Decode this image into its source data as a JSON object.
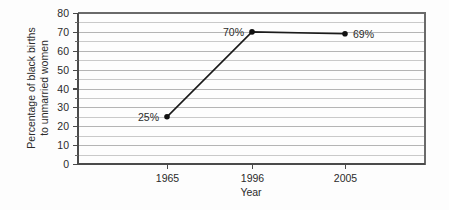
{
  "chart_data": {
    "type": "line",
    "title": "",
    "xlabel": "Year",
    "ylabel_line1": "Percentage of black births",
    "ylabel_line2": "to unmarried women",
    "categories": [
      "1965",
      "1996",
      "2005"
    ],
    "x": [
      1965,
      1996,
      2005
    ],
    "values": [
      25,
      70,
      69
    ],
    "point_labels": [
      "25%",
      "70%",
      "69%"
    ],
    "series": [
      {
        "name": "Percentage of black births to unmarried women",
        "values": [
          25,
          70,
          69
        ]
      }
    ],
    "ylim": [
      0,
      80
    ],
    "y_major_ticks": [
      0,
      10,
      20,
      30,
      40,
      50,
      60,
      70,
      80
    ],
    "y_major_tick_labels": [
      "0",
      "10",
      "20",
      "30",
      "40",
      "50",
      "60",
      "70",
      "80"
    ],
    "y_minor_ticks": [
      5,
      15,
      25,
      35,
      45,
      55,
      65,
      75
    ],
    "y_gridlines": [
      0,
      5,
      10,
      15,
      20,
      25,
      30,
      35,
      40,
      45,
      50,
      55,
      60,
      65,
      70,
      75,
      80
    ],
    "x_tick_labels": [
      "1965",
      "1996",
      "2005"
    ],
    "grid": true,
    "grid_axis": "y",
    "legend": false,
    "legend_position": "none",
    "colors": {
      "series_line": "#1a1a1a",
      "marker": "#111111",
      "gridline": "#c9c9c9",
      "frame": "#6a6a6a",
      "text": "#2b2b2b",
      "background": "#fdfdfd"
    },
    "label_placement": [
      "left",
      "left",
      "right"
    ]
  }
}
